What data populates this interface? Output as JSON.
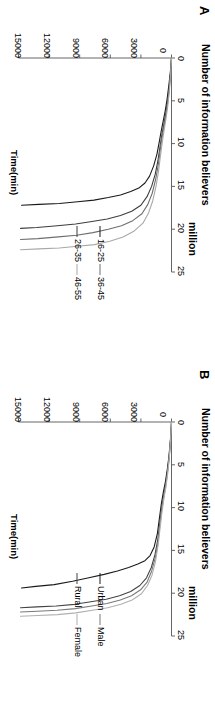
{
  "figure": {
    "panels": [
      {
        "id": "A",
        "letter": "A",
        "title_line1": "Number of information believers",
        "title_line2": "million",
        "x_axis": {
          "label": "Number of information believers million",
          "ticks": [
            "0",
            "5",
            "10",
            "15",
            "20",
            "25"
          ],
          "min": 0,
          "max": 25
        },
        "y_axis": {
          "label": "Time(min)",
          "ticks": [
            "0",
            "3000",
            "6000",
            "9000",
            "12000",
            "15000"
          ],
          "min": 0,
          "max": 15000
        },
        "legend": [
          {
            "label": "16-25",
            "color": "#1a1a1a"
          },
          {
            "label": "26-35",
            "color": "#3d3d3d"
          },
          {
            "label": "36-45",
            "color": "#6e6e6e"
          },
          {
            "label": "46-55",
            "color": "#a8a8a8"
          }
        ]
      },
      {
        "id": "B",
        "letter": "B",
        "title_line1": "Number of information believers",
        "title_line2": "million",
        "x_axis": {
          "label": "Number of information believers million",
          "ticks": [
            "0",
            "5",
            "10",
            "15",
            "20",
            "25"
          ],
          "min": 0,
          "max": 25
        },
        "y_axis": {
          "label": "Time(min)",
          "ticks": [
            "0",
            "3000",
            "6000",
            "9000",
            "12000",
            "15000"
          ],
          "min": 0,
          "max": 15000
        },
        "legend": [
          {
            "label": "Urban",
            "color": "#1a1a1a"
          },
          {
            "label": "Rural",
            "color": "#444444"
          },
          {
            "label": "Male",
            "color": "#7a7a7a"
          },
          {
            "label": "Female",
            "color": "#b0b0b0"
          }
        ]
      }
    ]
  },
  "chart_data": [
    {
      "type": "line",
      "title": "Number of information believers million",
      "panel": "A",
      "xlabel": "Number of information believers million",
      "ylabel": "Time(min)",
      "xlim": [
        0,
        25
      ],
      "ylim": [
        0,
        15000
      ],
      "xticks": [
        0,
        5,
        10,
        15,
        20,
        25
      ],
      "yticks": [
        0,
        3000,
        6000,
        9000,
        12000,
        15000
      ],
      "grid": false,
      "legend_position": "inside-lower-middle",
      "note": "x = number of information believers (million); y = time (min). Curves are cumulative-adoption trajectories that rise steeply then plateau.",
      "series": [
        {
          "name": "16-25",
          "color": "#1a1a1a",
          "x": [
            0.0,
            1.6,
            3.2,
            4.8,
            6.2,
            7.4,
            8.6,
            9.8,
            11.2,
            12.6,
            13.8,
            14.6,
            15.2,
            15.6,
            16.0,
            16.3,
            16.6,
            16.8,
            17.0,
            17.1,
            17.2
          ],
          "y": [
            0,
            110,
            260,
            430,
            620,
            820,
            1020,
            1200,
            1420,
            1750,
            2150,
            2600,
            3200,
            4000,
            5000,
            6200,
            7600,
            9200,
            11000,
            13000,
            14700
          ]
        },
        {
          "name": "26-35",
          "color": "#3d3d3d",
          "x": [
            0.0,
            1.8,
            3.6,
            5.2,
            6.6,
            7.8,
            9.0,
            10.4,
            12.0,
            13.6,
            15.0,
            16.2,
            17.2,
            17.9,
            18.4,
            18.8,
            19.1,
            19.4,
            19.6,
            19.8,
            19.9
          ],
          "y": [
            0,
            100,
            240,
            400,
            580,
            760,
            950,
            1130,
            1330,
            1600,
            1950,
            2400,
            3000,
            3900,
            5000,
            6300,
            7800,
            9400,
            11200,
            13200,
            14800
          ]
        },
        {
          "name": "36-45",
          "color": "#6e6e6e",
          "x": [
            0.0,
            1.9,
            3.8,
            5.4,
            6.8,
            8.0,
            9.3,
            10.8,
            12.5,
            14.2,
            15.8,
            17.1,
            18.2,
            19.0,
            19.6,
            20.0,
            20.4,
            20.7,
            20.9,
            21.1,
            21.2
          ],
          "y": [
            0,
            95,
            230,
            390,
            560,
            740,
            930,
            1110,
            1300,
            1560,
            1890,
            2320,
            2900,
            3800,
            4900,
            6200,
            7700,
            9300,
            11100,
            13100,
            14800
          ]
        },
        {
          "name": "46-55",
          "color": "#a8a8a8",
          "x": [
            0.0,
            2.0,
            4.0,
            5.7,
            7.1,
            8.4,
            9.8,
            11.4,
            13.2,
            15.0,
            16.7,
            18.1,
            19.3,
            20.2,
            20.9,
            21.4,
            21.8,
            22.0,
            22.2,
            22.3,
            22.4
          ],
          "y": [
            0,
            90,
            220,
            375,
            540,
            720,
            900,
            1080,
            1270,
            1520,
            1840,
            2250,
            2800,
            3650,
            4750,
            6050,
            7550,
            9200,
            11000,
            13000,
            14800
          ]
        }
      ]
    },
    {
      "type": "line",
      "title": "Number of information believers million",
      "panel": "B",
      "xlabel": "Number of information believers million",
      "ylabel": "Time(min)",
      "xlim": [
        0,
        25
      ],
      "ylim": [
        0,
        15000
      ],
      "xticks": [
        0,
        5,
        10,
        15,
        20,
        25
      ],
      "yticks": [
        0,
        3000,
        6000,
        9000,
        12000,
        15000
      ],
      "grid": false,
      "legend_position": "inside-lower-middle",
      "note": "x = number of information believers (million); y = time (min). Stepped plateaus before final saturation.",
      "series": [
        {
          "name": "Urban",
          "color": "#1a1a1a",
          "x": [
            0.0,
            2.0,
            4.0,
            5.6,
            7.0,
            8.2,
            9.6,
            11.2,
            13.0,
            14.6,
            15.6,
            16.2,
            16.6,
            17.0,
            17.4,
            17.8,
            18.2,
            18.6,
            19.0,
            19.2,
            19.4
          ],
          "y": [
            0,
            100,
            250,
            420,
            600,
            800,
            1000,
            1180,
            1380,
            1700,
            2100,
            2600,
            3300,
            4200,
            5300,
            6600,
            8100,
            9700,
            11500,
            13300,
            14700
          ]
        },
        {
          "name": "Rural",
          "color": "#444444",
          "x": [
            0.0,
            2.1,
            4.2,
            5.9,
            7.3,
            8.6,
            10.1,
            11.8,
            13.7,
            15.5,
            17.0,
            18.2,
            19.1,
            19.8,
            20.3,
            20.7,
            21.0,
            21.3,
            21.5,
            21.6,
            21.7
          ],
          "y": [
            0,
            95,
            240,
            405,
            580,
            775,
            970,
            1150,
            1340,
            1620,
            1980,
            2450,
            3100,
            4000,
            5100,
            6400,
            7900,
            9500,
            11300,
            13200,
            14800
          ]
        },
        {
          "name": "Male",
          "color": "#7a7a7a",
          "x": [
            0.0,
            2.1,
            4.3,
            6.0,
            7.5,
            8.8,
            10.3,
            12.1,
            14.1,
            15.9,
            17.4,
            18.7,
            19.6,
            20.3,
            20.8,
            21.2,
            21.5,
            21.8,
            22.0,
            22.1,
            22.2
          ],
          "y": [
            0,
            92,
            235,
            398,
            570,
            765,
            955,
            1135,
            1325,
            1595,
            1940,
            2390,
            3030,
            3920,
            5020,
            6320,
            7820,
            9430,
            11230,
            13150,
            14800
          ]
        },
        {
          "name": "Female",
          "color": "#b0b0b0",
          "x": [
            0.0,
            2.2,
            4.4,
            6.2,
            7.7,
            9.0,
            10.6,
            12.4,
            14.4,
            16.3,
            17.9,
            19.1,
            20.1,
            20.8,
            21.3,
            21.7,
            22.0,
            22.3,
            22.5,
            22.6,
            22.7
          ],
          "y": [
            0,
            90,
            230,
            390,
            560,
            750,
            940,
            1120,
            1310,
            1570,
            1910,
            2350,
            2980,
            3860,
            4960,
            6260,
            7760,
            9380,
            11180,
            13100,
            14800
          ]
        }
      ]
    }
  ]
}
